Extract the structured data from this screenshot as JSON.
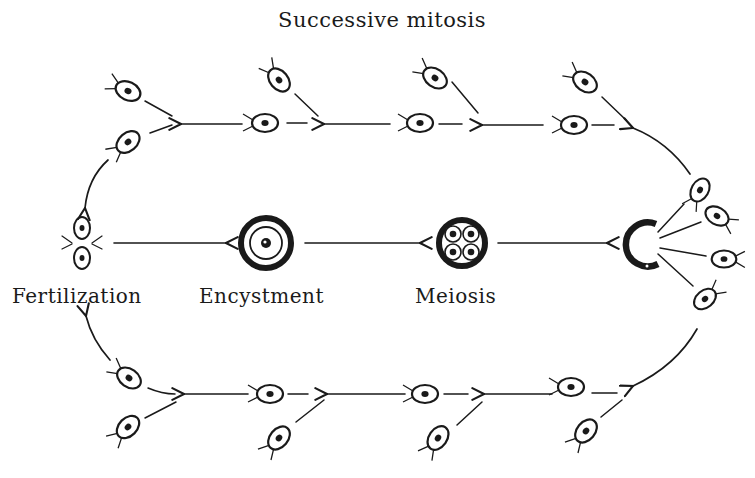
{
  "diagram": {
    "title": "Successive mitosis",
    "stages": [
      {
        "id": "fertilization",
        "label": "Fertilization"
      },
      {
        "id": "encystment",
        "label": "Encystment"
      },
      {
        "id": "meiosis",
        "label": "Meiosis"
      },
      {
        "id": "release",
        "label": ""
      }
    ],
    "flow": [
      "Fertilization -> Encystment",
      "Encystment -> Meiosis",
      "Meiosis -> Release of zoospores",
      "Zoospores -> Successive mitosis (top branch) -> Fertilization",
      "Zoospores -> Successive mitosis (bottom branch) -> Fertilization"
    ],
    "colors": {
      "ink": "#1a1a1a",
      "background": "#ffffff"
    },
    "icons": [
      "biflagellate-cell-icon",
      "zygote-pair-icon",
      "cyst-icon",
      "meiotic-tetrad-icon",
      "ruptured-cyst-icon",
      "arrow-icon"
    ]
  }
}
